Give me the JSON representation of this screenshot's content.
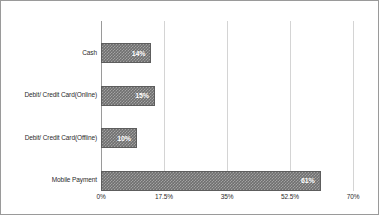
{
  "chart_data": {
    "type": "bar",
    "orientation": "horizontal",
    "title": "",
    "subtitle": "",
    "xlabel": "",
    "ylabel": "",
    "categories": [
      "Cash",
      "Debit/ Credit Card(Online)",
      "Debit/ Credit Card(Offline)",
      "Mobile Payment"
    ],
    "values": [
      14,
      15,
      10,
      61
    ],
    "data_labels": [
      "14%",
      "15%",
      "10%",
      "61%"
    ],
    "xlim": [
      0,
      70
    ],
    "xticks": [
      0,
      17.5,
      35,
      52.5,
      70
    ],
    "xtick_labels": [
      "0%",
      "17.5%",
      "35%",
      "52.5%",
      "70%"
    ],
    "grid": "vertical",
    "legend": "none",
    "bar_color": "#6f6f6f",
    "bar_edge_color": "#5d5d5d",
    "bar_pattern": "dotted-checker",
    "value_label_color": "#ffffff",
    "gridline_color": "#d4d4d4",
    "axis_color": "#9a9a9a",
    "text_color": "#2b2b2b",
    "frame_color": "#9a9a9a"
  }
}
